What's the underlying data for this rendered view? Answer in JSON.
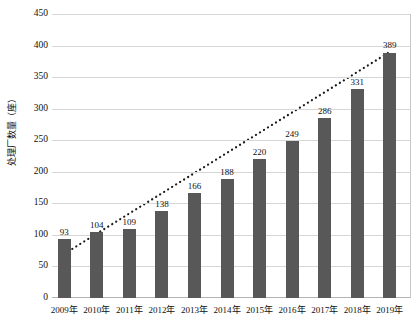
{
  "chart_data": {
    "type": "bar",
    "title": "",
    "subtitle": "",
    "xlabel": "",
    "ylabel": "处理厂数量（座）",
    "categories": [
      "2009年",
      "2010年",
      "2011年",
      "2012年",
      "2013年",
      "2014年",
      "2015年",
      "2016年",
      "2017年",
      "2018年",
      "2019年"
    ],
    "values": [
      93,
      104,
      109,
      138,
      166,
      188,
      220,
      249,
      286,
      331,
      389
    ],
    "series": [
      {
        "name": "处理厂数量（座）",
        "type": "bar",
        "values": [
          93,
          104,
          109,
          138,
          166,
          188,
          220,
          249,
          286,
          331,
          389
        ]
      },
      {
        "name": "趋势线",
        "type": "line",
        "style": "dotted",
        "values": [
          70,
          102,
          134,
          166,
          198,
          230,
          262,
          294,
          326,
          358,
          390
        ]
      }
    ],
    "ylim": [
      0,
      450
    ],
    "ytick_step": 50,
    "yticks": [
      0,
      50,
      100,
      150,
      200,
      250,
      300,
      350,
      400,
      450
    ],
    "ytick_labels": [
      "0",
      "50",
      "100",
      "150",
      "200",
      "250",
      "300",
      "350",
      "400",
      "450"
    ],
    "grid": true,
    "grid_axis": "y",
    "legend": false,
    "legend_position": "none",
    "data_labels": [
      "93",
      "104",
      "109",
      "138",
      "166",
      "188",
      "220",
      "249",
      "286",
      "331",
      "389"
    ],
    "colors": {
      "bar": "#585858",
      "trendline": "#1a1a1a",
      "gridline": "#d6d6d6",
      "axis": "#b4b4b4",
      "text": "#0f0f0f",
      "background": "#ffffff"
    }
  }
}
